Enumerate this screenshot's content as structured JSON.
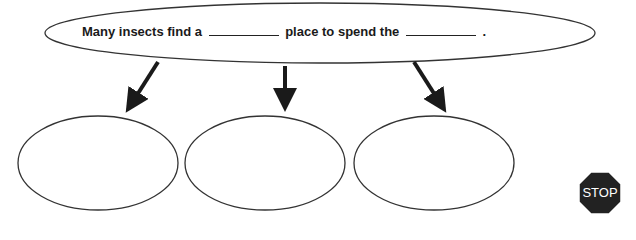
{
  "diagram": {
    "main_sentence": {
      "part1": "Many insects find a",
      "part2": "place to spend the",
      "part3": "."
    },
    "branches": [
      {
        "id": "left",
        "text": ""
      },
      {
        "id": "middle",
        "text": ""
      },
      {
        "id": "right",
        "text": ""
      }
    ],
    "stop_sign": {
      "label": "STOP",
      "color": "#222222"
    }
  }
}
